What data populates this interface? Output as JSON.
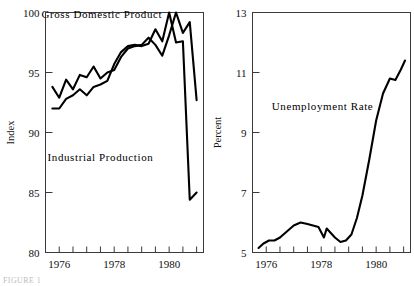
{
  "figure": {
    "caption": "FIGURE 1",
    "background": "#ffffff",
    "line_color": "#000000",
    "axis_color": "#3a3a3a"
  },
  "chart_data": [
    {
      "type": "line",
      "id": "output-chart",
      "title": "",
      "xlabel": "",
      "ylabel": "Index",
      "xlim": [
        1975.5,
        1981.25
      ],
      "ylim": [
        80,
        100
      ],
      "yticks": [
        80,
        85,
        90,
        95,
        100
      ],
      "ytick_labels": [
        "80",
        "85",
        "90",
        "95",
        "100"
      ],
      "xticks": [
        1976,
        1976.5,
        1977,
        1977.5,
        1978,
        1978.5,
        1979,
        1979.5,
        1980,
        1980.5,
        1981
      ],
      "xtick_labels": [
        "1976",
        "",
        "",
        "",
        "1978",
        "",
        "",
        "",
        "1980",
        "",
        ""
      ],
      "xtick_label_values": [
        1976,
        1978,
        1980
      ],
      "grid": false,
      "legend": "inline-annotations",
      "annotations": [
        {
          "text": "Gross Domestic Product",
          "x": 1977.55,
          "y": 99.55
        },
        {
          "text": "Industrial Production",
          "x": 1977.5,
          "y": 87.6
        }
      ],
      "series": [
        {
          "name": "Gross Domestic Product",
          "x": [
            1975.75,
            1976.0,
            1976.25,
            1976.5,
            1976.75,
            1977.0,
            1977.25,
            1977.5,
            1977.75,
            1978.0,
            1978.25,
            1978.5,
            1978.75,
            1979.0,
            1979.25,
            1979.5,
            1979.75,
            1980.0,
            1980.25,
            1980.5,
            1980.75,
            1981.0
          ],
          "values": [
            93.8,
            92.9,
            94.4,
            93.6,
            94.8,
            94.6,
            95.5,
            94.5,
            95.0,
            95.2,
            96.3,
            97.0,
            97.2,
            97.3,
            97.9,
            97.3,
            96.4,
            98.1,
            100.0,
            98.3,
            99.2,
            92.7
          ]
        },
        {
          "name": "Industrial Production",
          "x": [
            1975.75,
            1976.0,
            1976.25,
            1976.5,
            1976.75,
            1977.0,
            1977.25,
            1977.5,
            1977.75,
            1978.0,
            1978.25,
            1978.5,
            1978.75,
            1979.0,
            1979.25,
            1979.5,
            1979.75,
            1980.0,
            1980.25,
            1980.5,
            1980.75,
            1981.0
          ],
          "values": [
            92.0,
            92.0,
            92.8,
            93.1,
            93.6,
            93.1,
            93.8,
            94.0,
            94.3,
            95.7,
            96.7,
            97.2,
            97.3,
            97.2,
            97.4,
            98.6,
            97.6,
            100.0,
            97.5,
            97.6,
            84.4,
            85.0
          ]
        }
      ]
    },
    {
      "type": "line",
      "id": "unemployment-chart",
      "title": "",
      "xlabel": "",
      "ylabel": "Percent",
      "xlim": [
        1975.5,
        1981.25
      ],
      "ylim": [
        5,
        13
      ],
      "yticks": [
        5,
        7,
        9,
        11,
        13
      ],
      "ytick_labels": [
        "5",
        "7",
        "9",
        "11",
        "13"
      ],
      "xticks": [
        1976,
        1976.5,
        1977,
        1977.5,
        1978,
        1978.5,
        1979,
        1979.5,
        1980,
        1980.5,
        1981
      ],
      "xtick_labels": [
        "1976",
        "",
        "",
        "",
        "1978",
        "",
        "",
        "",
        "1980",
        "",
        ""
      ],
      "xtick_label_values": [
        1976,
        1978,
        1980
      ],
      "grid": false,
      "legend": "inline-annotations",
      "annotations": [
        {
          "text": "Unemployment Rate",
          "x": 1978.05,
          "y": 9.75
        }
      ],
      "series": [
        {
          "name": "Unemployment Rate",
          "x": [
            1975.72,
            1975.9,
            1976.1,
            1976.3,
            1976.5,
            1976.75,
            1977.0,
            1977.25,
            1977.5,
            1977.7,
            1977.9,
            1978.1,
            1978.2,
            1978.35,
            1978.5,
            1978.7,
            1978.9,
            1979.1,
            1979.3,
            1979.5,
            1979.75,
            1980.0,
            1980.25,
            1980.5,
            1980.7,
            1980.9,
            1981.05
          ],
          "values": [
            5.15,
            5.3,
            5.4,
            5.4,
            5.5,
            5.7,
            5.9,
            6.0,
            5.95,
            5.9,
            5.85,
            5.5,
            5.8,
            5.65,
            5.5,
            5.35,
            5.4,
            5.6,
            6.15,
            6.9,
            8.1,
            9.4,
            10.3,
            10.8,
            10.75,
            11.1,
            11.4
          ]
        }
      ]
    }
  ]
}
